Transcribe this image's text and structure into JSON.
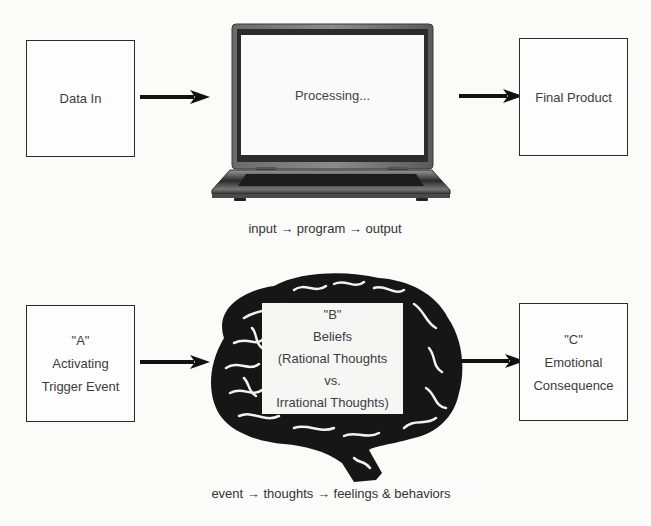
{
  "top_row": {
    "input_box": {
      "label": "Data In"
    },
    "processor": {
      "screen_text": "Processing...",
      "icon": "laptop-icon"
    },
    "output_box": {
      "label": "Final Product"
    },
    "caption": "input → program → output"
  },
  "bottom_row": {
    "a_box": {
      "lines": [
        "\"A\"",
        "Activating",
        "Trigger Event"
      ]
    },
    "b_box": {
      "icon": "brain-icon",
      "lines": [
        "\"B\"",
        "Beliefs",
        "(Rational Thoughts",
        "vs.",
        "Irrational Thoughts)"
      ]
    },
    "c_box": {
      "lines": [
        "\"C\"",
        "Emotional",
        "Consequence"
      ]
    },
    "caption": "event → thoughts → feelings & behaviors"
  },
  "colors": {
    "background": "#fbfbfa",
    "ink": "#111111",
    "border": "#2b2b2b",
    "text": "#3c3c3c"
  }
}
